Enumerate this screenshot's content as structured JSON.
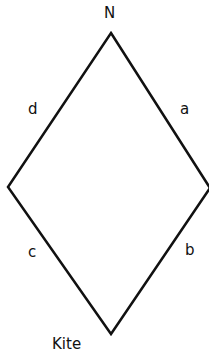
{
  "diagram": {
    "title": "Kite",
    "top_label": "N",
    "sides": {
      "a": "a",
      "b": "b",
      "c": "c",
      "d": "d"
    },
    "vertices": {
      "top": [
        111,
        33
      ],
      "right": [
        210,
        188
      ],
      "bottom": [
        111,
        334
      ],
      "left": [
        8,
        187
      ]
    },
    "stroke_color": "#111111"
  }
}
